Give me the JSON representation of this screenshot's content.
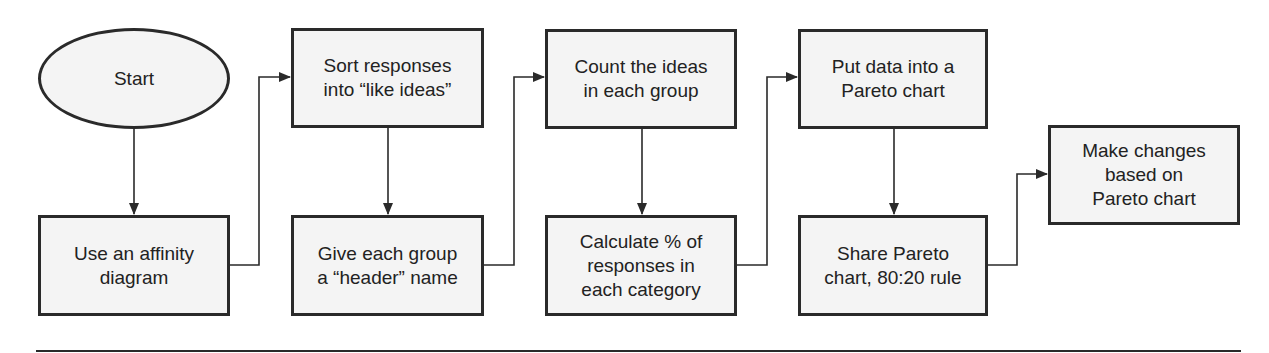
{
  "diagram": {
    "type": "flowchart",
    "colors": {
      "stroke": "#2a2a2a",
      "fill": "#f4f4f4",
      "text": "#222222",
      "background": "#ffffff"
    },
    "nodes": [
      {
        "id": "start",
        "shape": "ellipse",
        "label": "Start"
      },
      {
        "id": "affinity",
        "shape": "rect",
        "label": "Use an affinity\ndiagram"
      },
      {
        "id": "sort",
        "shape": "rect",
        "label": "Sort responses\ninto “like ideas”"
      },
      {
        "id": "header",
        "shape": "rect",
        "label": "Give each group\na “header” name"
      },
      {
        "id": "count",
        "shape": "rect",
        "label": "Count the ideas\nin each group"
      },
      {
        "id": "calculate",
        "shape": "rect",
        "label": "Calculate % of\nresponses in\neach category"
      },
      {
        "id": "pareto",
        "shape": "rect",
        "label": "Put data into a\nPareto chart"
      },
      {
        "id": "share",
        "shape": "rect",
        "label": "Share Pareto\nchart, 80:20 rule"
      },
      {
        "id": "changes",
        "shape": "rect",
        "label": "Make changes\nbased on\nPareto chart"
      }
    ],
    "edges": [
      {
        "from": "start",
        "to": "affinity"
      },
      {
        "from": "affinity",
        "to": "sort"
      },
      {
        "from": "sort",
        "to": "header"
      },
      {
        "from": "header",
        "to": "count"
      },
      {
        "from": "count",
        "to": "calculate"
      },
      {
        "from": "calculate",
        "to": "pareto"
      },
      {
        "from": "pareto",
        "to": "share"
      },
      {
        "from": "share",
        "to": "changes"
      }
    ]
  }
}
